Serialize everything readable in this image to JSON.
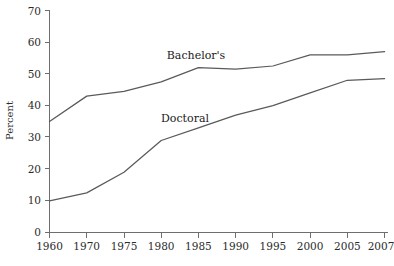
{
  "chart_data": {
    "type": "line",
    "title": "",
    "xlabel": "",
    "ylabel": "Percent",
    "x": [
      "1960",
      "1970",
      "1975",
      "1980",
      "1985",
      "1990",
      "1995",
      "2000",
      "2005",
      "2007"
    ],
    "categories": [
      "1960",
      "1970",
      "1975",
      "1980",
      "1985",
      "1990",
      "1995",
      "2000",
      "2005",
      "2007"
    ],
    "series": [
      {
        "name": "Bachelor's",
        "values": [
          35,
          43,
          44.5,
          47.5,
          52,
          51.5,
          52.5,
          56,
          56,
          57
        ],
        "label_text": "Bachelor's"
      },
      {
        "name": "Doctoral",
        "values": [
          10,
          12.5,
          19,
          29,
          33,
          37,
          40,
          44,
          48,
          48.5
        ],
        "label_text": "Doctoral"
      }
    ],
    "ylim": [
      0,
      70
    ],
    "yticks": [
      0,
      10,
      20,
      30,
      40,
      50,
      60,
      70
    ],
    "ytick_labels": [
      "0",
      "10",
      "20",
      "30",
      "40",
      "50",
      "60",
      "70"
    ],
    "xtick_labels": [
      "1960",
      "1970",
      "1975",
      "1980",
      "1985",
      "1990",
      "1995",
      "2000",
      "2005",
      "2007"
    ],
    "grid": false,
    "legend_position": "inline-annotation",
    "line_color": "#5a5a5a",
    "axis_color": "#6e6e6e"
  },
  "axis": {
    "y_title": "Percent"
  },
  "annotations": {
    "bachelors": "Bachelor's",
    "doctoral": "Doctoral"
  }
}
